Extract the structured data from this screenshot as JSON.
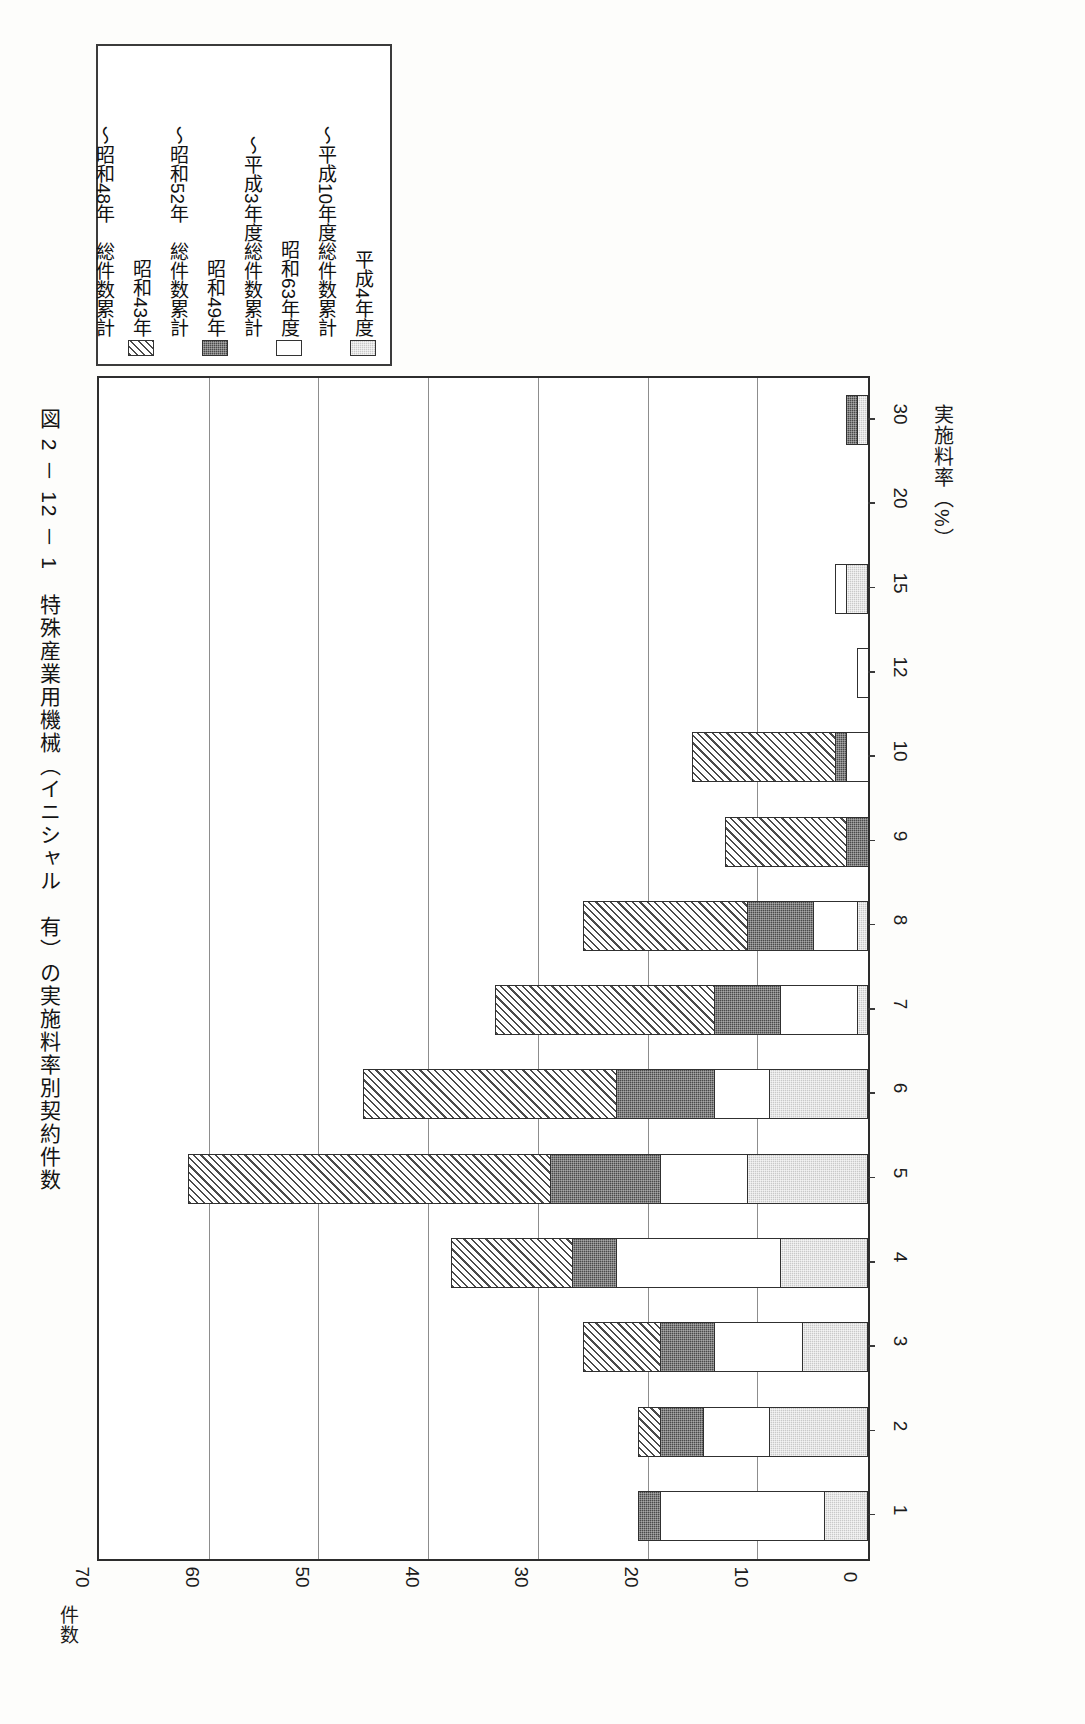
{
  "figure": {
    "title": "図 2 － 12 － 1　特殊産業用機械（イニシャル　有）の実施料率別契約件数"
  },
  "legend": {
    "items": [
      {
        "label": "平成4年度",
        "swatch": "gray",
        "icon": "legend-swatch-light-gray"
      },
      {
        "label": "〜平成10年度総件数累計",
        "swatch": "blank",
        "icon": "legend-swatch-none"
      },
      {
        "label": "昭和63年度",
        "swatch": "white",
        "icon": "legend-swatch-white"
      },
      {
        "label": "〜平成3年度総件数累計",
        "swatch": "blank",
        "icon": "legend-swatch-none"
      },
      {
        "label": "昭和49年",
        "swatch": "dark",
        "icon": "legend-swatch-dark"
      },
      {
        "label": "〜昭和52年　総件数累計",
        "swatch": "blank",
        "icon": "legend-swatch-none"
      },
      {
        "label": "昭和43年",
        "swatch": "hatch",
        "icon": "legend-swatch-hatched"
      },
      {
        "label": "〜昭和48年　総件数累計",
        "swatch": "blank",
        "icon": "legend-swatch-none"
      }
    ]
  },
  "axes": {
    "value_axis": {
      "title": "件数",
      "ticks": [
        70,
        60,
        50,
        40,
        30,
        20,
        10,
        0
      ],
      "min": 0,
      "max": 70,
      "grid": true
    },
    "category_axis": {
      "title": "実施料率（%）",
      "ticks": [
        "1",
        "2",
        "3",
        "4",
        "5",
        "6",
        "7",
        "8",
        "9",
        "10",
        "12",
        "15",
        "20",
        "30"
      ]
    }
  },
  "colors": {
    "frame": "#2d2d2d",
    "grid": "#8d8d8d",
    "segment_gray": "#c9c9c9",
    "segment_white": "#ffffff",
    "segment_dark": "#4a4a4a",
    "segment_hatch": "#4b4b4b",
    "text": "#141414"
  },
  "chart_data": {
    "type": "bar",
    "orientation": "horizontal-stacked",
    "title": "図 2 － 12 － 1　特殊産業用機械（イニシャル　有）の実施料率別契約件数",
    "xlabel": "実施料率（%）",
    "ylabel": "件数",
    "ylim": [
      0,
      70
    ],
    "grid": true,
    "legend_position": "top-left",
    "categories": [
      "1",
      "2",
      "3",
      "4",
      "5",
      "6",
      "7",
      "8",
      "9",
      "10",
      "12",
      "15",
      "20",
      "30"
    ],
    "series": [
      {
        "name": "〜昭和48年 総件数累計",
        "style": "hatch",
        "values": [
          0,
          2,
          7,
          11,
          33,
          23,
          20,
          15,
          11,
          13,
          0,
          0,
          0,
          0
        ]
      },
      {
        "name": "昭和49年〜昭和52年 総件数累計",
        "style": "dark",
        "values": [
          2,
          4,
          5,
          4,
          10,
          9,
          6,
          6,
          2,
          1,
          0,
          0,
          0,
          1
        ]
      },
      {
        "name": "昭和63年〜平成3年度 総件数累計",
        "style": "white",
        "values": [
          15,
          6,
          8,
          15,
          8,
          5,
          7,
          4,
          0,
          2,
          1,
          1,
          0,
          0
        ]
      },
      {
        "name": "平成4年度〜平成10年度 総件数累計",
        "style": "gray",
        "values": [
          4,
          9,
          6,
          8,
          11,
          9,
          1,
          1,
          0,
          0,
          0,
          2,
          0,
          1
        ]
      }
    ],
    "totals": [
      21,
      21,
      26,
      38,
      62,
      46,
      34,
      26,
      13,
      16,
      1,
      3,
      1,
      2
    ]
  }
}
